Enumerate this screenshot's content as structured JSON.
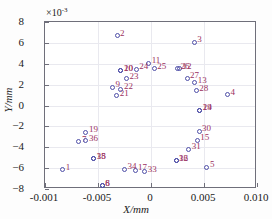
{
  "chart_data": {
    "type": "scatter",
    "title": "",
    "xlabel": "X/mm",
    "ylabel": "Y/mm",
    "y_exponent_text": "×10",
    "y_exponent_power": "-3",
    "xlim": [
      -0.001,
      0.01
    ],
    "ylim": [
      -8,
      8
    ],
    "grid": true,
    "legend": null,
    "xticks": [
      "-0.001",
      "-0.005",
      "0",
      "0.005",
      "0.010"
    ],
    "xtick_values": [
      -0.001,
      -0.005,
      0,
      0.005,
      0.01
    ],
    "ytick_values": [
      8,
      6,
      4,
      2,
      0,
      -2,
      -4,
      -6,
      -8
    ],
    "yticks": [
      "8",
      "6",
      "4",
      "2",
      "0",
      "-2",
      "-4",
      "-6",
      "-8"
    ],
    "marker": "open-circle",
    "marker_color": "#4f4fa8",
    "label_color": "#9b3060",
    "points": [
      {
        "label": "1",
        "px": 0.0835,
        "py": -6.15
      },
      {
        "label": "2",
        "px": 0.34,
        "py": 6.7
      },
      {
        "label": "3",
        "px": 0.7035,
        "py": 6.05
      },
      {
        "label": "4",
        "px": 0.861,
        "py": 1.05
      },
      {
        "label": "5",
        "px": 0.764,
        "py": -5.9
      },
      {
        "label": "6",
        "px": 0.27,
        "py": -7.7
      },
      {
        "label": "7",
        "px": 0.16,
        "py": -3.45
      },
      {
        "label": "8",
        "px": 0.27,
        "py": -7.7
      },
      {
        "label": "9",
        "px": 0.318,
        "py": 1.75
      },
      {
        "label": "10",
        "px": 0.358,
        "py": 3.35
      },
      {
        "label": "11",
        "px": 0.489,
        "py": 4.05
      },
      {
        "label": "12",
        "px": 0.634,
        "py": 3.5
      },
      {
        "label": "13",
        "px": 0.706,
        "py": 2.2
      },
      {
        "label": "14",
        "px": 0.73,
        "py": -0.45
      },
      {
        "label": "15",
        "px": 0.718,
        "py": -3.35
      },
      {
        "label": "16",
        "px": 0.618,
        "py": -5.3
      },
      {
        "label": "17",
        "px": 0.425,
        "py": -6.2
      },
      {
        "label": "18",
        "px": 0.23,
        "py": -5.1
      },
      {
        "label": "19",
        "px": 0.193,
        "py": -2.55
      },
      {
        "label": "20",
        "px": 0.358,
        "py": 3.35
      },
      {
        "label": "21",
        "px": 0.338,
        "py": 0.95
      },
      {
        "label": "22",
        "px": 0.358,
        "py": 1.55
      },
      {
        "label": "23",
        "px": 0.385,
        "py": 2.55
      },
      {
        "label": "24",
        "px": 0.43,
        "py": 3.45
      },
      {
        "label": "25",
        "px": 0.515,
        "py": 3.5
      },
      {
        "label": "26",
        "px": 0.625,
        "py": 3.5
      },
      {
        "label": "27",
        "px": 0.67,
        "py": 2.6
      },
      {
        "label": "28",
        "px": 0.713,
        "py": 1.4
      },
      {
        "label": "29",
        "px": 0.73,
        "py": -0.45
      },
      {
        "label": "30",
        "px": 0.727,
        "py": -2.45
      },
      {
        "label": "31",
        "px": 0.678,
        "py": -4.2
      },
      {
        "label": "32",
        "px": 0.618,
        "py": -5.3
      },
      {
        "label": "33",
        "px": 0.47,
        "py": -6.35
      },
      {
        "label": "34",
        "px": 0.375,
        "py": -6.1
      },
      {
        "label": "35",
        "px": 0.23,
        "py": -5.1
      },
      {
        "label": "36",
        "px": 0.193,
        "py": -3.4
      }
    ]
  }
}
